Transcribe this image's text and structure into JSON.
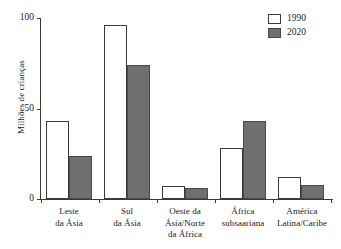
{
  "chart_data": {
    "type": "bar",
    "title": "",
    "xlabel": "",
    "ylabel": "Milhões de crianças",
    "ylim": [
      0,
      100
    ],
    "yticks": [
      0,
      50,
      100
    ],
    "ytick_labels": [
      "0",
      "50",
      "100"
    ],
    "grid": false,
    "legend_position": "top-right",
    "categories": [
      "Leste\nda Ásia",
      "Sul\nda Ásia",
      "Oeste da\nÁsia/Norte\nda África",
      "África\nsubsaariana",
      "América\nLatina/Caribe"
    ],
    "category_lines": [
      [
        "Leste",
        "da Ásia"
      ],
      [
        "Sul",
        "da Ásia"
      ],
      [
        "Oeste da",
        "Ásia/Norte",
        "da África"
      ],
      [
        "África",
        "subsaariana"
      ],
      [
        "América",
        "Latina/Caribe"
      ]
    ],
    "series": [
      {
        "name": "1990",
        "color": "#ffffff",
        "values": [
          43,
          96,
          7,
          28,
          12
        ]
      },
      {
        "name": "2020",
        "color": "#6f6f6f",
        "values": [
          24,
          74,
          6,
          43,
          8
        ]
      }
    ]
  },
  "legend": {
    "entries": [
      {
        "label": "1990"
      },
      {
        "label": "2020"
      }
    ]
  }
}
